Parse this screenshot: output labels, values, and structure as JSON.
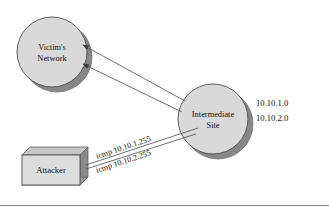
{
  "diagram": {
    "colors": {
      "shape_fill": "#d9d9d9",
      "shape_shadow": "#878787",
      "outline": "#4d4d4d",
      "line": "#555555",
      "text": "#111111",
      "rule": "#888888",
      "background": "#ffffff"
    },
    "nodes": {
      "victim": {
        "label_line1": "Victim's",
        "label_line2": "Network",
        "shape": "circle"
      },
      "intermediate": {
        "label_line1": "Intermediate",
        "label_line2": "Site",
        "shape": "circle"
      },
      "attacker": {
        "label": "Attacker",
        "shape": "box3d"
      }
    },
    "annotations": {
      "network_addresses": [
        "10.10.1.0",
        "10.10.2.0"
      ],
      "flows": [
        "icmp 10.10.1.255",
        "icmp 10.10.2.255"
      ]
    },
    "footer_rule": true
  }
}
